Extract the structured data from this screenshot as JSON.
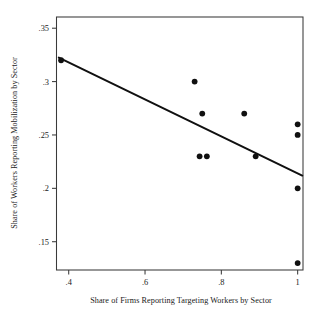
{
  "chart_data": {
    "type": "scatter",
    "title": "",
    "xlabel": "Share of Firms Reporting Targeting Workers by Sector",
    "ylabel": "Share of Workers Reporting Mobilization by Sector",
    "xlim": [
      0.368,
      1.014
    ],
    "ylim": [
      0.1235,
      0.3605
    ],
    "grid": false,
    "legend": null,
    "xticks": [
      0.4,
      0.6,
      0.8,
      1.0
    ],
    "xticklabels": [
      ".4",
      ".6",
      ".8",
      "1"
    ],
    "yticks": [
      0.15,
      0.2,
      0.25,
      0.3,
      0.35
    ],
    "yticklabels": [
      ".15",
      ".2",
      ".25",
      ".3",
      ".35"
    ],
    "series": [
      {
        "name": "sector observations",
        "marker": "filled-circle",
        "color": "#101010",
        "points": [
          {
            "x": 0.38,
            "y": 0.32
          },
          {
            "x": 0.73,
            "y": 0.3
          },
          {
            "x": 0.75,
            "y": 0.27
          },
          {
            "x": 0.86,
            "y": 0.27
          },
          {
            "x": 0.743,
            "y": 0.23
          },
          {
            "x": 0.762,
            "y": 0.23
          },
          {
            "x": 0.89,
            "y": 0.23
          },
          {
            "x": 1.0,
            "y": 0.26
          },
          {
            "x": 1.0,
            "y": 0.25
          },
          {
            "x": 1.0,
            "y": 0.2
          },
          {
            "x": 1.0,
            "y": 0.13
          }
        ]
      }
    ],
    "fit_line": {
      "name": "linear fit",
      "color": "#101010",
      "x0": 0.374,
      "y0": 0.3225,
      "x1": 1.012,
      "y1": 0.212
    }
  }
}
